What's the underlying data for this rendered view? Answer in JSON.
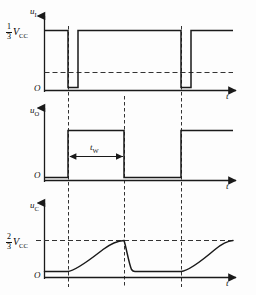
{
  "figure": {
    "width": 256,
    "height": 295,
    "line_color": "#1a1a1a",
    "dash_color": "#333333",
    "background": "#fdfdfd"
  },
  "panels": [
    {
      "id": "panel-ui",
      "signal_label": "u",
      "signal_subscript": "I",
      "origin_label": "O",
      "time_label": "t",
      "threshold": {
        "numerator": "1",
        "denominator": "3",
        "symbol": "V",
        "symbol_subscript": "CC",
        "text": "1/3 VCC"
      },
      "axis": {
        "x0": 44,
        "y0": 90,
        "x1": 233,
        "y_high": 30,
        "y_dash": 72
      },
      "waveform": {
        "type": "digital-pulse-train",
        "description": "High level with two narrow negative-going trigger pulses",
        "high_level": "1/3 VCC reference top",
        "segments": [
          {
            "from_x": 44,
            "to_x": 68,
            "level": "high"
          },
          {
            "from_x": 68,
            "to_x": 78,
            "level": "low"
          },
          {
            "from_x": 78,
            "to_x": 181,
            "level": "high"
          },
          {
            "from_x": 181,
            "to_x": 191,
            "level": "low"
          },
          {
            "from_x": 191,
            "to_x": 233,
            "level": "high"
          }
        ]
      }
    },
    {
      "id": "panel-uo",
      "signal_label": "u",
      "signal_subscript": "O",
      "origin_label": "O",
      "time_label": "t",
      "pulse_width_label": "t",
      "pulse_width_subscript": "W",
      "axis": {
        "x0": 44,
        "y0": 180,
        "x1": 233,
        "y_high": 130
      },
      "waveform": {
        "type": "digital-pulse",
        "description": "Output stays low, goes high for one pulse width after each trigger",
        "segments": [
          {
            "from_x": 44,
            "to_x": 68,
            "level": "low"
          },
          {
            "from_x": 68,
            "to_x": 124,
            "level": "high"
          },
          {
            "from_x": 124,
            "to_x": 181,
            "level": "low"
          },
          {
            "from_x": 181,
            "to_x": 233,
            "level": "high"
          }
        ]
      }
    },
    {
      "id": "panel-uc",
      "signal_label": "u",
      "signal_subscript": "C",
      "origin_label": "O",
      "time_label": "t",
      "threshold": {
        "numerator": "2",
        "denominator": "3",
        "symbol": "V",
        "symbol_subscript": "CC",
        "text": "2/3 VCC"
      },
      "axis": {
        "x0": 44,
        "y0": 277,
        "x1": 233,
        "y_thresh": 240
      },
      "waveform": {
        "type": "rc-charge-discharge",
        "description": "Capacitor charges exponentially toward 2/3 VCC then discharges rapidly",
        "events": [
          {
            "x": 44,
            "to_x": 68,
            "phase": "idle-low"
          },
          {
            "x": 68,
            "to_x": 124,
            "phase": "exponential-charge-to-threshold"
          },
          {
            "x": 124,
            "to_x": 132,
            "phase": "rapid-discharge"
          },
          {
            "x": 132,
            "to_x": 181,
            "phase": "idle-low"
          },
          {
            "x": 181,
            "to_x": 233,
            "phase": "exponential-charge-to-threshold"
          }
        ]
      }
    }
  ],
  "alignment_lines": [
    {
      "x": 68,
      "from_y": 30,
      "to_y": 285,
      "style": "dashed"
    },
    {
      "x": 124,
      "from_y": 95,
      "to_y": 285,
      "style": "dashed"
    },
    {
      "x": 181,
      "from_y": 30,
      "to_y": 285,
      "style": "dashed"
    }
  ]
}
